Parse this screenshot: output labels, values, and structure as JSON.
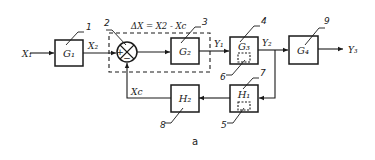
{
  "diagram": {
    "caption": "a",
    "equation": "ΔX = X2 - Xc",
    "colors": {
      "stroke": "#1a1a1a",
      "background": "#ffffff"
    },
    "blocks": [
      {
        "id": "G1",
        "label": "G₁",
        "number": "1"
      },
      {
        "id": "G2",
        "label": "G₂",
        "number": "3"
      },
      {
        "id": "G3",
        "label": "G₃",
        "number": "4"
      },
      {
        "id": "G4",
        "label": "G₄",
        "number": "9"
      },
      {
        "id": "H1",
        "label": "H₁",
        "number": "7"
      },
      {
        "id": "H2",
        "label": "H₂",
        "number": "8"
      }
    ],
    "summing_junction": {
      "number": "2",
      "plus": "+",
      "minus": "−"
    },
    "inner_elements": [
      {
        "in_block": "G3",
        "number": "6"
      },
      {
        "in_block": "H1",
        "number": "5"
      }
    ],
    "signals": {
      "input": "X₁",
      "after_g1": "X₂",
      "after_g2": "Y₁",
      "after_g3": "Y₂",
      "output": "Y₃",
      "feedback": "Xc"
    }
  }
}
